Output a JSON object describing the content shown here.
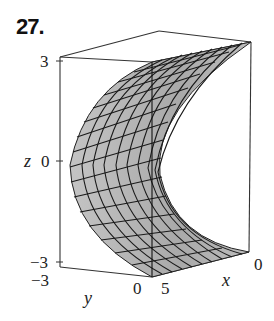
{
  "problem": {
    "number": "27."
  },
  "figure": {
    "type": "3d-surface-plot",
    "surface_fill": "#b5b5b5",
    "grid_color": "#1a1a1a",
    "box_color": "#333333",
    "axes": {
      "z": {
        "label": "z",
        "ticks": [
          "3",
          "0",
          "−3"
        ]
      },
      "y": {
        "label": "y",
        "ticks": [
          "−3",
          "0"
        ]
      },
      "x": {
        "label": "x",
        "ticks": [
          "5",
          "0"
        ]
      }
    }
  }
}
